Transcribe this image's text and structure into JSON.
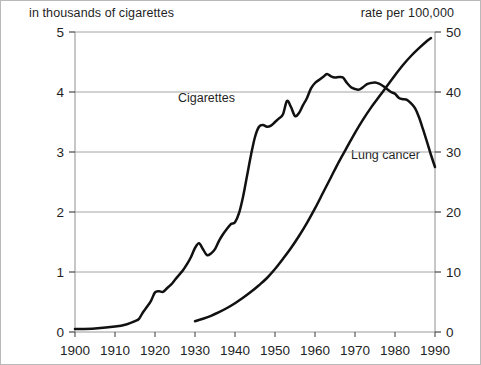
{
  "chart_data": {
    "type": "line",
    "title": "",
    "subtitle": "",
    "xlabel": "",
    "ylabel": "in thousands of cigarettes",
    "y2label": "rate per 100,000",
    "xlim": [
      1900,
      1990
    ],
    "ylim": [
      0,
      5
    ],
    "y2lim": [
      0,
      50
    ],
    "xticks": [
      1900,
      1910,
      1920,
      1930,
      1940,
      1950,
      1960,
      1970,
      1980,
      1990
    ],
    "xticklabels": [
      "1900",
      "1910",
      "1920",
      "1930",
      "1940",
      "1950",
      "1960",
      "1970",
      "1980",
      "1990"
    ],
    "yticks": [
      0,
      1,
      2,
      3,
      4,
      5
    ],
    "yticklabels": [
      "0",
      "1",
      "2",
      "3",
      "4",
      "5"
    ],
    "y2ticks": [
      0,
      10,
      20,
      30,
      40,
      50
    ],
    "y2ticklabels": [
      "0",
      "10",
      "20",
      "30",
      "40",
      "50"
    ],
    "grid": "horizontal",
    "legend_position": "inline-annotations",
    "series": [
      {
        "name": "Cigarettes",
        "axis": "left",
        "units": "thousands of cigarettes per person",
        "color": "#111111",
        "label_x": 1935,
        "label_y": 4.0,
        "x": [
          1900,
          1905,
          1910,
          1913,
          1915,
          1916,
          1917,
          1918,
          1919,
          1920,
          1921,
          1922,
          1923,
          1924,
          1925,
          1926,
          1927,
          1928,
          1929,
          1930,
          1931,
          1932,
          1933,
          1934,
          1935,
          1936,
          1937,
          1938,
          1939,
          1940,
          1941,
          1942,
          1943,
          1944,
          1945,
          1946,
          1947,
          1948,
          1949,
          1950,
          1951,
          1952,
          1953,
          1954,
          1955,
          1956,
          1957,
          1958,
          1959,
          1960,
          1961,
          1962,
          1963,
          1964,
          1965,
          1966,
          1967,
          1968,
          1969,
          1970,
          1971,
          1972,
          1973,
          1974,
          1975,
          1976,
          1977,
          1978,
          1979,
          1980,
          1981,
          1982,
          1983,
          1984,
          1985,
          1986,
          1987,
          1988,
          1989,
          1990
        ],
        "y": [
          0.05,
          0.06,
          0.09,
          0.13,
          0.18,
          0.22,
          0.33,
          0.42,
          0.52,
          0.66,
          0.68,
          0.67,
          0.73,
          0.79,
          0.87,
          0.95,
          1.03,
          1.13,
          1.25,
          1.4,
          1.48,
          1.38,
          1.28,
          1.31,
          1.38,
          1.52,
          1.63,
          1.72,
          1.8,
          1.83,
          1.98,
          2.25,
          2.6,
          2.95,
          3.25,
          3.42,
          3.45,
          3.42,
          3.44,
          3.5,
          3.56,
          3.63,
          3.85,
          3.75,
          3.6,
          3.65,
          3.78,
          3.9,
          4.06,
          4.15,
          4.2,
          4.25,
          4.3,
          4.26,
          4.24,
          4.25,
          4.24,
          4.15,
          4.08,
          4.05,
          4.04,
          4.08,
          4.13,
          4.15,
          4.16,
          4.14,
          4.1,
          4.05,
          4.0,
          3.97,
          3.9,
          3.88,
          3.87,
          3.81,
          3.73,
          3.58,
          3.38,
          3.17,
          2.95,
          2.75
        ]
      },
      {
        "name": "Lung cancer",
        "axis": "right",
        "units": "deaths per 100,000 population",
        "color": "#111111",
        "label_x": 1972,
        "label_y": 29,
        "x": [
          1930,
          1932,
          1934,
          1936,
          1938,
          1940,
          1942,
          1944,
          1946,
          1948,
          1950,
          1952,
          1954,
          1956,
          1958,
          1960,
          1962,
          1964,
          1966,
          1968,
          1970,
          1972,
          1974,
          1976,
          1978,
          1980,
          1982,
          1984,
          1986,
          1988,
          1989
        ],
        "y": [
          1.8,
          2.2,
          2.7,
          3.3,
          4.0,
          4.8,
          5.7,
          6.7,
          7.8,
          9.0,
          10.5,
          12.2,
          14.0,
          16.0,
          18.2,
          20.6,
          23.2,
          25.8,
          28.4,
          30.8,
          33.2,
          35.4,
          37.4,
          39.2,
          41.0,
          42.8,
          44.5,
          46.0,
          47.3,
          48.5,
          49.0
        ]
      }
    ]
  }
}
